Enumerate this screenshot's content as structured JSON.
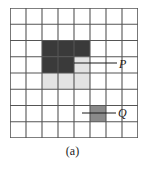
{
  "figure": {
    "caption": "(a)",
    "grid": {
      "rows": 8,
      "cols": 8,
      "line_color": "#555555",
      "border_color": "#444444",
      "cell_background": "#ffffff"
    },
    "colors": {
      "dark_gray": "#3a3a3a",
      "light_gray": "#e3e3e3",
      "medium_gray": "#8a8a8a",
      "line": "#555555",
      "text": "#1a1a1a",
      "background": "#ffffff"
    },
    "shaded_cells": [
      {
        "row": 3,
        "col": 3,
        "shade": "dark_gray"
      },
      {
        "row": 3,
        "col": 4,
        "shade": "dark_gray"
      },
      {
        "row": 3,
        "col": 5,
        "shade": "dark_gray"
      },
      {
        "row": 4,
        "col": 3,
        "shade": "dark_gray"
      },
      {
        "row": 4,
        "col": 4,
        "shade": "dark_gray"
      },
      {
        "row": 4,
        "col": 5,
        "shade": "light_gray"
      },
      {
        "row": 5,
        "col": 3,
        "shade": "light_gray"
      },
      {
        "row": 5,
        "col": 4,
        "shade": "light_gray"
      },
      {
        "row": 5,
        "col": 5,
        "shade": "light_gray"
      },
      {
        "row": 7,
        "col": 6,
        "shade": "medium_gray"
      }
    ],
    "annotations": [
      {
        "id": "p",
        "label": "P",
        "target_row": 4,
        "target_col": 5,
        "leader_from_x": 74,
        "leader_from_y": 63,
        "leader_to_x": 117,
        "leader_to_y": 63
      },
      {
        "id": "q",
        "label": "Q",
        "target_row": 7,
        "target_col": 6,
        "leader_from_x": 82,
        "leader_from_y": 113,
        "leader_to_x": 116,
        "leader_to_y": 113
      }
    ]
  },
  "chart_data": {
    "type": "heatmap",
    "title": "(a)",
    "xlabel": "",
    "ylabel": "",
    "grid": true,
    "legend_position": "none",
    "categories": [
      "1",
      "2",
      "3",
      "4",
      "5",
      "6",
      "7",
      "8"
    ],
    "row_labels": [
      "1",
      "2",
      "3",
      "4",
      "5",
      "6",
      "7",
      "8"
    ],
    "values": [
      [
        0,
        0,
        0,
        0,
        0,
        0,
        0,
        0
      ],
      [
        0,
        0,
        0,
        0,
        0,
        0,
        0,
        0
      ],
      [
        0,
        0,
        2,
        2,
        2,
        0,
        0,
        0
      ],
      [
        0,
        0,
        2,
        2,
        1,
        0,
        0,
        0
      ],
      [
        0,
        0,
        1,
        1,
        1,
        0,
        0,
        0
      ],
      [
        0,
        0,
        0,
        0,
        0,
        0,
        0,
        0
      ],
      [
        0,
        0,
        0,
        0,
        0,
        1.5,
        0,
        0
      ],
      [
        0,
        0,
        0,
        0,
        0,
        0,
        0,
        0
      ]
    ],
    "value_legend": {
      "0": "#ffffff",
      "1": "#e3e3e3",
      "1.5": "#8a8a8a",
      "2": "#3a3a3a"
    },
    "annotations": [
      "P",
      "Q"
    ]
  }
}
